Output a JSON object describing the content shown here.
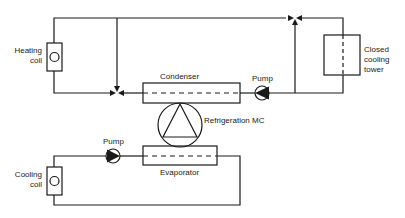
{
  "diagram": {
    "labels": {
      "heating_coil": [
        "Heating",
        "coil"
      ],
      "cooling_coil": [
        "Cooling",
        "coil"
      ],
      "condenser": "Condenser",
      "evaporator": "Evaporator",
      "pump_upper": "Pump",
      "pump_lower": "Pump",
      "refrigeration": "Refrigeration  MC",
      "cooling_tower": [
        "Closed",
        "cooling",
        "tower"
      ]
    },
    "colors": {
      "line": "#1a1a1a",
      "background": "#ffffff"
    }
  }
}
